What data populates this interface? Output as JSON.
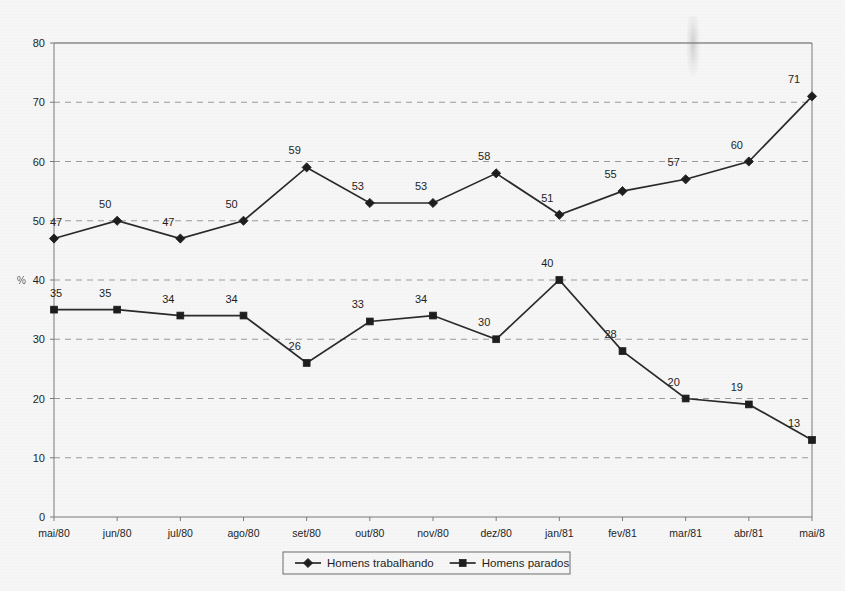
{
  "chart_data": {
    "type": "line",
    "title": "",
    "subtitle": "",
    "xlabel": "",
    "ylabel": "%",
    "categories": [
      "mai/80",
      "jun/80",
      "jul/80",
      "ago/80",
      "set/80",
      "out/80",
      "nov/80",
      "dez/80",
      "jan/81",
      "fev/81",
      "mar/81",
      "abr/81",
      "mai/8"
    ],
    "series": [
      {
        "name": "Homens trabalhando",
        "marker": "diamond",
        "color": "#1e1e1e",
        "values": [
          47,
          50,
          47,
          50,
          59,
          53,
          53,
          58,
          51,
          55,
          57,
          60,
          71
        ]
      },
      {
        "name": "Homens parados",
        "marker": "square",
        "color": "#1e1e1e",
        "values": [
          35,
          35,
          34,
          34,
          26,
          33,
          34,
          30,
          40,
          28,
          20,
          19,
          13
        ]
      }
    ],
    "ylim": [
      0,
      80
    ],
    "yticks": [
      0,
      10,
      20,
      30,
      40,
      50,
      60,
      70,
      80
    ],
    "ytick_labels": [
      "0",
      "10",
      "20",
      "30",
      "40",
      "50",
      "60",
      "70",
      "80"
    ],
    "grid": true,
    "grid_style": "dashed-horizontal",
    "legend_position": "bottom",
    "data_labels": true,
    "axis_unit_symbol": "%"
  },
  "legend": {
    "entries": [
      {
        "label": "Homens trabalhando",
        "marker": "diamond"
      },
      {
        "label": "Homens parados",
        "marker": "square"
      }
    ]
  },
  "colors": {
    "background": "#f6f6f6",
    "ink": "#1e1e1e",
    "axis": "#7a7a7a",
    "grid": "#9a9a9a"
  }
}
